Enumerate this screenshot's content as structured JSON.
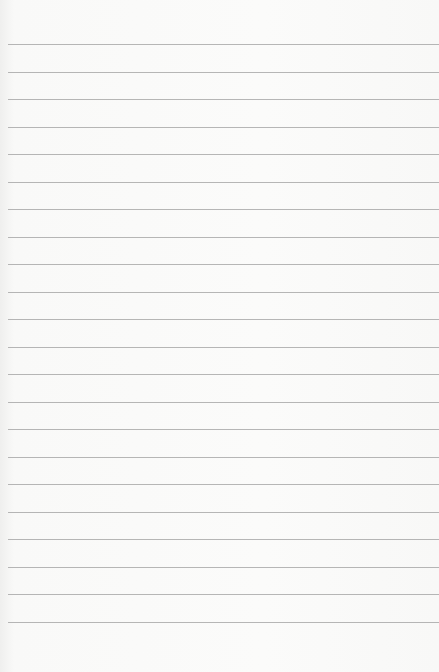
{
  "paper": {
    "type": "lined-notepad",
    "line_color": "#a9a9a9",
    "background_color": "#f9f9f8",
    "first_line_y": 44,
    "line_spacing": 27.5,
    "line_count": 22,
    "text": ""
  }
}
